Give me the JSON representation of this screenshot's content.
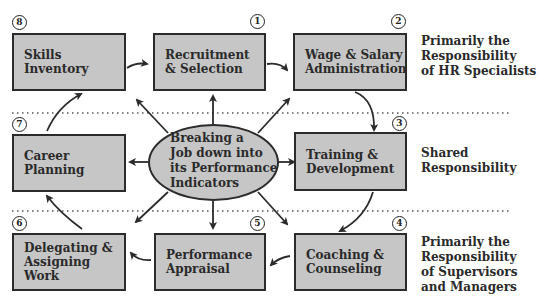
{
  "diagram": {
    "center": {
      "label": "Breaking a\nJob down into\nits Performance\nIndicators"
    },
    "boxes": [
      {
        "number": "1",
        "label": "Recruitment\n& Selection"
      },
      {
        "number": "2",
        "label": "Wage & Salary\nAdministration"
      },
      {
        "number": "3",
        "label": "Training &\nDevelopment"
      },
      {
        "number": "4",
        "label": "Coaching &\nCounseling"
      },
      {
        "number": "5",
        "label": "Performance\nAppraisal"
      },
      {
        "number": "6",
        "label": "Delegating &\nAssigning Work"
      },
      {
        "number": "7",
        "label": "Career\nPlanning"
      },
      {
        "number": "8",
        "label": "Skills\nInventory"
      }
    ],
    "responsibility_bands": [
      {
        "label": "Primarily the\nResponsibility\nof HR Specialists"
      },
      {
        "label": "Shared\nResponsibility"
      },
      {
        "label": "Primarily the\nResponsibility\nof Supervisors\nand Managers"
      }
    ],
    "colors": {
      "box_fill": "#c6c6c6",
      "stroke": "#2b2b2b"
    }
  }
}
